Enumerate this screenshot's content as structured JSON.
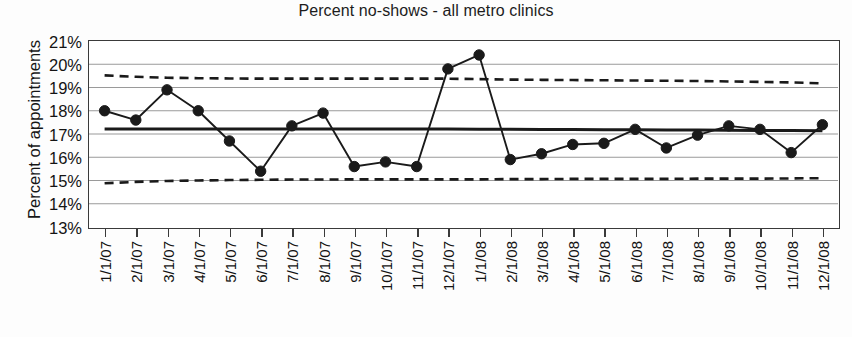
{
  "chart_data": {
    "type": "line",
    "title": "Percent no-shows - all metro clinics",
    "xlabel": "",
    "ylabel": "Percent of appointments",
    "ylim": [
      13,
      21
    ],
    "ytick_labels": [
      "21%",
      "20%",
      "19%",
      "18%",
      "17%",
      "16%",
      "15%",
      "14%",
      "13%"
    ],
    "ytick_values": [
      21,
      20,
      19,
      18,
      17,
      16,
      15,
      14,
      13
    ],
    "grid": true,
    "legend": "none",
    "categories": [
      "1/1/07",
      "2/1/07",
      "3/1/07",
      "4/1/07",
      "5/1/07",
      "6/1/07",
      "7/1/07",
      "8/1/07",
      "9/1/07",
      "10/1/07",
      "11/1/07",
      "12/1/07",
      "1/1/08",
      "2/1/08",
      "3/1/08",
      "4/1/08",
      "5/1/08",
      "6/1/08",
      "7/1/08",
      "8/1/08",
      "9/1/08",
      "10/1/08",
      "11/1/08",
      "12/1/08"
    ],
    "series": [
      {
        "name": "Percent no-shows",
        "style": "line-with-markers",
        "color": "#1a1a1a",
        "values": [
          18.0,
          17.6,
          18.9,
          18.0,
          16.7,
          15.4,
          17.35,
          17.9,
          15.6,
          15.8,
          15.6,
          19.8,
          20.4,
          15.9,
          16.15,
          16.55,
          16.6,
          17.2,
          16.4,
          16.95,
          17.35,
          17.2,
          16.2,
          17.4
        ]
      },
      {
        "name": "Upper control limit",
        "style": "dashed",
        "color": "#1a1a1a",
        "values": [
          19.52,
          19.46,
          19.42,
          19.4,
          19.39,
          19.38,
          19.38,
          19.38,
          19.38,
          19.38,
          19.38,
          19.38,
          19.36,
          19.34,
          19.33,
          19.32,
          19.31,
          19.3,
          19.29,
          19.28,
          19.26,
          19.24,
          19.22,
          19.18
        ]
      },
      {
        "name": "Center line",
        "style": "solid-thick",
        "color": "#1a1a1a",
        "values": [
          17.22,
          17.22,
          17.22,
          17.22,
          17.22,
          17.22,
          17.22,
          17.22,
          17.22,
          17.22,
          17.22,
          17.22,
          17.2,
          17.2,
          17.19,
          17.19,
          17.18,
          17.18,
          17.17,
          17.17,
          17.16,
          17.15,
          17.15,
          17.14
        ]
      },
      {
        "name": "Lower control limit",
        "style": "dashed",
        "color": "#1a1a1a",
        "values": [
          14.88,
          14.94,
          14.98,
          15.0,
          15.02,
          15.03,
          15.04,
          15.04,
          15.05,
          15.05,
          15.05,
          15.05,
          15.05,
          15.06,
          15.06,
          15.07,
          15.07,
          15.07,
          15.07,
          15.08,
          15.08,
          15.08,
          15.09,
          15.1
        ]
      }
    ]
  }
}
